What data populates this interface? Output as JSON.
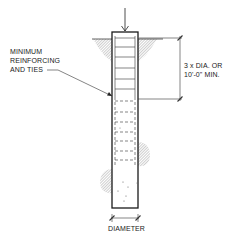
{
  "diagram": {
    "type": "pile-foundation-section",
    "labels": {
      "reinforcing": [
        "MINIMUM",
        "REINFORCING",
        "AND TIES"
      ],
      "depth": [
        "3 x DIA. OR",
        "10'-0\" MIN."
      ],
      "diameter": "DIAMETER"
    },
    "colors": {
      "line": "#1a1a1a",
      "hatch": "#777777",
      "background": "#ffffff"
    }
  }
}
